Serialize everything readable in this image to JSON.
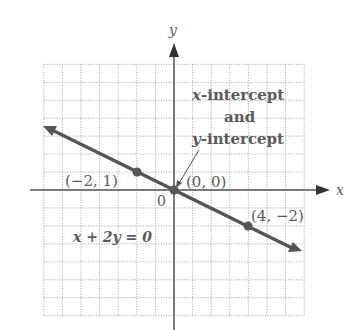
{
  "chart_data": {
    "type": "line",
    "title": "",
    "equation": "x + 2y = 0",
    "xlabel": "x",
    "ylabel": "y",
    "xlim": [
      -7,
      7
    ],
    "ylim": [
      -7,
      7
    ],
    "grid": true,
    "origin_label": "0",
    "series": [
      {
        "name": "x + 2y = 0",
        "x": [
          -7,
          7
        ],
        "y": [
          3.5,
          -3.5
        ]
      }
    ],
    "points": [
      {
        "x": -2,
        "y": 1,
        "label": "(−2, 1)"
      },
      {
        "x": 0,
        "y": 0,
        "label": "(0, 0)"
      },
      {
        "x": 4,
        "y": -2,
        "label": "(4, −2)"
      }
    ],
    "annotations": [
      {
        "text_lines": [
          "x-intercept",
          "and",
          "y-intercept"
        ],
        "points_to": [
          0,
          0
        ]
      }
    ]
  },
  "labels": {
    "x_axis": "x",
    "y_axis": "y",
    "origin": "0",
    "equation": "x + 2y = 0",
    "pt1": "(−2, 1)",
    "pt2": "(0, 0)",
    "pt3": "(4, −2)",
    "ann_line1_var": "x",
    "ann_line1_rest": "-intercept",
    "ann_line2": "and",
    "ann_line3_var": "y",
    "ann_line3_rest": "-intercept"
  }
}
